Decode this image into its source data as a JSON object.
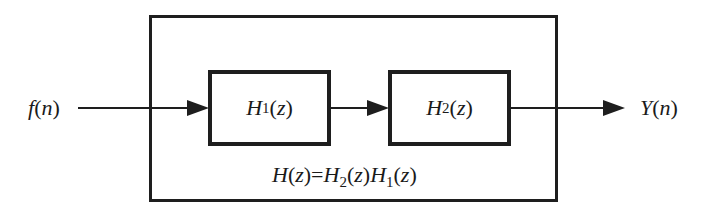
{
  "diagram": {
    "input_label": {
      "fn": "f",
      "arg": "n"
    },
    "output_label": {
      "fn": "Y",
      "arg": "n"
    },
    "blocks": [
      {
        "name": "H",
        "subscript": "1",
        "arg": "z"
      },
      {
        "name": "H",
        "subscript": "2",
        "arg": "z"
      }
    ],
    "formula": {
      "lhs": "H",
      "lhs_arg": "z",
      "eq": "=",
      "t1": "H",
      "t1_sub": "2",
      "t1_arg": "z",
      "t2": "H",
      "t2_sub": "1",
      "t2_arg": "z"
    },
    "colors": {
      "stroke": "#1e1e1e",
      "background": "#ffffff"
    }
  }
}
